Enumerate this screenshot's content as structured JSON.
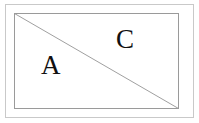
{
  "figure": {
    "background_color": "#ffffff",
    "outer_rect": {
      "name": "outer-frame",
      "x": 5,
      "y": 4,
      "width": 189,
      "height": 114,
      "stroke": "#c9c9c9",
      "stroke_width": 1,
      "fill": "none"
    },
    "inner_rect": {
      "name": "inner-rectangle",
      "x": 14,
      "y": 13,
      "width": 165,
      "height": 96,
      "stroke": "#9a9a9a",
      "stroke_width": 1,
      "fill": "none"
    },
    "diagonal": {
      "name": "diagonal-line",
      "x1": 14,
      "y1": 13,
      "x2": 179,
      "y2": 109,
      "stroke": "#a0a0a0",
      "stroke_width": 1
    },
    "labels": [
      {
        "id": "A",
        "text": "A",
        "x": 41,
        "y": 52,
        "font_size": 27,
        "color": "#111111",
        "region": "lower-left-triangle"
      },
      {
        "id": "C",
        "text": "C",
        "x": 116,
        "y": 26,
        "font_size": 27,
        "color": "#111111",
        "region": "upper-right-triangle"
      }
    ]
  }
}
